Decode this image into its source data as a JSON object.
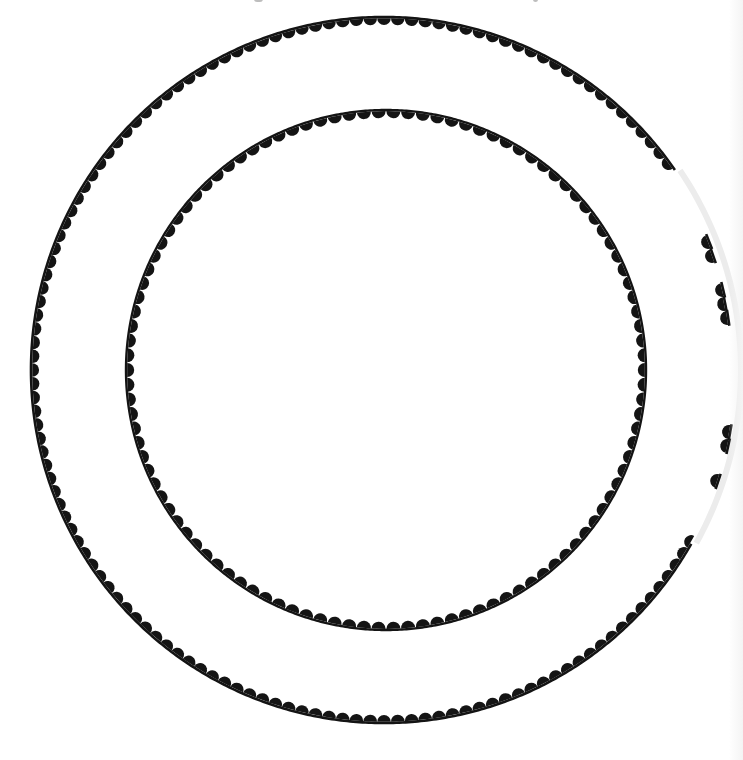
{
  "page": {
    "width": 743,
    "height": 760,
    "background": "#ffffff",
    "ink_color": "#141414"
  },
  "template": {
    "description": "Two concentric scalloped-edge circles",
    "rings": [
      {
        "name": "outer-ring",
        "cx": 384,
        "cy": 370,
        "radius": 353,
        "band_width": 2.6,
        "scallop_count": 160,
        "scallop_radius": 6.8,
        "scallop_direction": "inward",
        "hidden_arc_deg": [
          -34,
          29
        ]
      },
      {
        "name": "inner-ring",
        "cx": 386,
        "cy": 370,
        "radius": 260,
        "band_width": 2.4,
        "scallop_count": 110,
        "scallop_radius": 7,
        "scallop_direction": "inward",
        "hidden_arc_deg": null
      }
    ],
    "torn_fragments": [
      {
        "cx": 708,
        "cy": 242,
        "r": 7
      },
      {
        "cx": 712,
        "cy": 256,
        "r": 7
      },
      {
        "cx": 722,
        "cy": 290,
        "r": 7
      },
      {
        "cx": 724,
        "cy": 304,
        "r": 7
      },
      {
        "cx": 727,
        "cy": 318,
        "r": 7
      },
      {
        "cx": 729,
        "cy": 432,
        "r": 7
      },
      {
        "cx": 727,
        "cy": 446,
        "r": 7
      },
      {
        "cx": 717,
        "cy": 481,
        "r": 7
      }
    ]
  },
  "header": {
    "cut_off_text_marks": [
      {
        "x": 254,
        "w": 9
      },
      {
        "x": 533,
        "w": 5
      }
    ]
  }
}
